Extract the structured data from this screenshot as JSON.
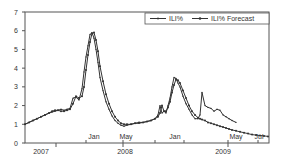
{
  "chart_data": {
    "type": "line",
    "title": "",
    "xlabel": "",
    "ylabel": "",
    "ylim": [
      0,
      7
    ],
    "yticks": [
      0,
      1,
      2,
      3,
      4,
      5,
      6,
      7
    ],
    "grid": false,
    "legend_position": "top-right",
    "x_month_labels": [
      {
        "label": "Jan",
        "x": 94
      },
      {
        "label": "May",
        "x": 126
      },
      {
        "label": "Jan",
        "x": 175
      },
      {
        "label": "May",
        "x": 236
      },
      {
        "label": "Jul",
        "x": 259
      }
    ],
    "x_year_labels": [
      {
        "label": "2007",
        "x": 41
      },
      {
        "label": "2008",
        "x": 125
      },
      {
        "label": "2009",
        "x": 223
      }
    ],
    "series": [
      {
        "name": "ILI%",
        "style": "line with small markers",
        "points": [
          [
            25,
            1.0
          ],
          [
            29,
            1.1
          ],
          [
            33,
            1.2
          ],
          [
            37,
            1.3
          ],
          [
            41,
            1.4
          ],
          [
            45,
            1.5
          ],
          [
            49,
            1.6
          ],
          [
            52,
            1.65
          ],
          [
            55,
            1.7
          ],
          [
            58,
            1.75
          ],
          [
            61,
            1.8
          ],
          [
            64,
            1.75
          ],
          [
            67,
            1.8
          ],
          [
            70,
            1.85
          ],
          [
            73,
            2.4
          ],
          [
            76,
            2.45
          ],
          [
            79,
            2.3
          ],
          [
            82,
            2.9
          ],
          [
            84,
            3.8
          ],
          [
            86,
            4.6
          ],
          [
            88,
            5.2
          ],
          [
            90,
            5.8
          ],
          [
            92,
            5.9
          ],
          [
            94,
            5.6
          ],
          [
            96,
            5.0
          ],
          [
            98,
            4.3
          ],
          [
            100,
            3.5
          ],
          [
            103,
            2.8
          ],
          [
            106,
            2.2
          ],
          [
            109,
            1.8
          ],
          [
            112,
            1.45
          ],
          [
            115,
            1.2
          ],
          [
            118,
            1.05
          ],
          [
            121,
            0.95
          ],
          [
            124,
            0.9
          ],
          [
            127,
            0.95
          ],
          [
            131,
            1.0
          ],
          [
            135,
            1.05
          ],
          [
            139,
            1.05
          ],
          [
            143,
            1.1
          ],
          [
            147,
            1.15
          ],
          [
            151,
            1.2
          ],
          [
            155,
            1.3
          ],
          [
            158,
            1.5
          ],
          [
            160,
            2.0
          ],
          [
            162,
            1.6
          ],
          [
            164,
            1.7
          ],
          [
            166,
            1.6
          ],
          [
            168,
            2.0
          ],
          [
            170,
            2.4
          ],
          [
            172,
            3.0
          ],
          [
            174,
            3.5
          ],
          [
            176,
            3.45
          ],
          [
            178,
            3.2
          ],
          [
            180,
            3.0
          ],
          [
            183,
            2.5
          ],
          [
            186,
            2.1
          ],
          [
            189,
            1.8
          ],
          [
            192,
            1.5
          ],
          [
            195,
            1.3
          ],
          [
            198,
            1.3
          ],
          [
            200,
            1.5
          ],
          [
            202,
            2.7
          ],
          [
            205,
            2.0
          ],
          [
            208,
            1.9
          ],
          [
            211,
            1.85
          ],
          [
            214,
            1.7
          ],
          [
            217,
            1.8
          ],
          [
            220,
            1.75
          ],
          [
            223,
            1.5
          ],
          [
            226,
            1.4
          ],
          [
            229,
            1.3
          ],
          [
            232,
            1.2
          ],
          [
            236,
            1.1
          ]
        ]
      },
      {
        "name": "ILI% Forecast",
        "style": "line with dot markers",
        "points": [
          [
            25,
            1.0
          ],
          [
            29,
            1.1
          ],
          [
            33,
            1.2
          ],
          [
            37,
            1.3
          ],
          [
            41,
            1.4
          ],
          [
            45,
            1.5
          ],
          [
            49,
            1.6
          ],
          [
            52,
            1.7
          ],
          [
            55,
            1.75
          ],
          [
            58,
            1.75
          ],
          [
            61,
            1.7
          ],
          [
            64,
            1.7
          ],
          [
            67,
            1.75
          ],
          [
            70,
            1.8
          ],
          [
            73,
            2.1
          ],
          [
            76,
            2.5
          ],
          [
            79,
            2.4
          ],
          [
            82,
            2.5
          ],
          [
            84,
            3.0
          ],
          [
            86,
            3.9
          ],
          [
            88,
            4.7
          ],
          [
            90,
            5.4
          ],
          [
            92,
            5.85
          ],
          [
            94,
            5.9
          ],
          [
            96,
            5.5
          ],
          [
            98,
            4.9
          ],
          [
            100,
            4.1
          ],
          [
            103,
            3.3
          ],
          [
            106,
            2.6
          ],
          [
            109,
            2.1
          ],
          [
            112,
            1.7
          ],
          [
            115,
            1.4
          ],
          [
            118,
            1.2
          ],
          [
            121,
            1.05
          ],
          [
            124,
            1.0
          ],
          [
            127,
            1.0
          ],
          [
            131,
            1.0
          ],
          [
            135,
            1.05
          ],
          [
            139,
            1.1
          ],
          [
            143,
            1.1
          ],
          [
            147,
            1.15
          ],
          [
            151,
            1.2
          ],
          [
            155,
            1.3
          ],
          [
            158,
            1.4
          ],
          [
            160,
            1.6
          ],
          [
            162,
            2.0
          ],
          [
            164,
            1.7
          ],
          [
            166,
            1.7
          ],
          [
            168,
            1.9
          ],
          [
            170,
            2.2
          ],
          [
            172,
            2.7
          ],
          [
            174,
            3.1
          ],
          [
            176,
            3.4
          ],
          [
            178,
            3.35
          ],
          [
            180,
            3.2
          ],
          [
            183,
            2.8
          ],
          [
            186,
            2.4
          ],
          [
            189,
            2.0
          ],
          [
            192,
            1.7
          ],
          [
            195,
            1.5
          ],
          [
            198,
            1.35
          ],
          [
            200,
            1.3
          ],
          [
            202,
            1.25
          ],
          [
            205,
            1.2
          ],
          [
            208,
            1.1
          ],
          [
            211,
            1.05
          ],
          [
            214,
            1.0
          ],
          [
            217,
            0.95
          ],
          [
            220,
            0.9
          ],
          [
            223,
            0.85
          ],
          [
            226,
            0.8
          ],
          [
            229,
            0.75
          ],
          [
            232,
            0.7
          ],
          [
            236,
            0.65
          ],
          [
            240,
            0.6
          ],
          [
            244,
            0.55
          ],
          [
            248,
            0.5
          ],
          [
            252,
            0.45
          ],
          [
            256,
            0.42
          ],
          [
            260,
            0.4
          ],
          [
            264,
            0.38
          ],
          [
            268,
            0.35
          ]
        ]
      }
    ]
  },
  "legend": {
    "items": [
      {
        "label": "ILI%"
      },
      {
        "label": "ILI% Forecast"
      }
    ]
  }
}
